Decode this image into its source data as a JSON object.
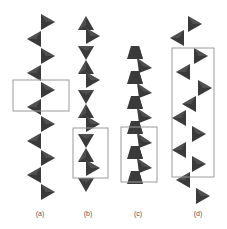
{
  "figure": {
    "panels": [
      {
        "label": "(a)",
        "chain_type": "zigzag-corner-sharing",
        "tetrahedra_count": 11,
        "unit_cell": "2 tetrahedra repeat"
      },
      {
        "label": "(b)",
        "chain_type": "paired-zigzag",
        "tetrahedra_count": 12,
        "unit_cell": "4 tetrahedra repeat"
      },
      {
        "label": "(c)",
        "chain_type": "trapezoid-zigzag",
        "tetrahedra_count": 11,
        "unit_cell": "4 tetrahedra repeat"
      },
      {
        "label": "(d)",
        "chain_type": "helical-zigzag",
        "tetrahedra_count": 11,
        "unit_cell": "7 tetrahedra repeat"
      }
    ],
    "colors": {
      "tetrahedron": "#3a3a3a",
      "tetrahedron_light": "#6a6a6a",
      "box": "#9a9a9a",
      "label": "#555555"
    }
  }
}
